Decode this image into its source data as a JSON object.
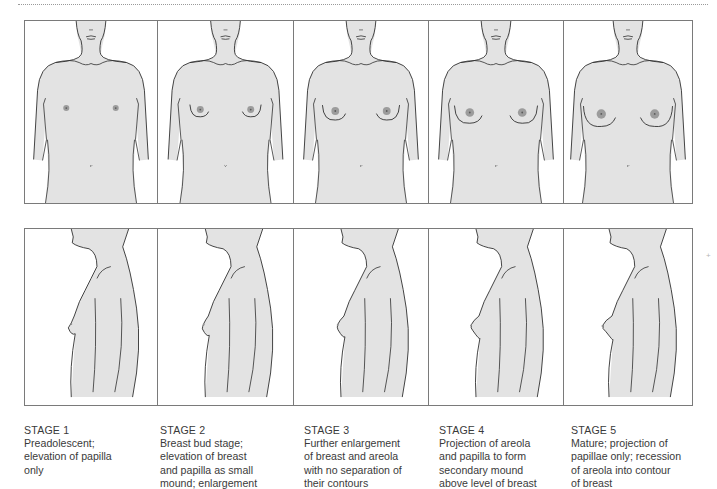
{
  "figure": {
    "colors": {
      "skin_fill": "#e3e3e3",
      "outline": "#2e2e2e",
      "areola": "#8f8f8f",
      "border": "#7a7a7a",
      "caption_text": "#3a3a3a"
    },
    "views": [
      "frontal",
      "lateral"
    ],
    "stages": [
      {
        "title": "STAGE 1",
        "description": "Preadolescent;\nelevation of papilla\nonly",
        "breast_development": 0.0,
        "areola_size": 0.35
      },
      {
        "title": "STAGE 2",
        "description": "Breast bud stage;\nelevation of breast\nand papilla as small\nmound; enlargement",
        "breast_development": 0.25,
        "areola_size": 0.5
      },
      {
        "title": "STAGE 3",
        "description": "Further enlargement\nof breast and areola\nwith no separation of\ntheir contours",
        "breast_development": 0.5,
        "areola_size": 0.65
      },
      {
        "title": "STAGE 4",
        "description": "Projection of areola\nand papilla to form\nsecondary mound\nabove level of breast",
        "breast_development": 0.75,
        "areola_size": 0.8
      },
      {
        "title": "STAGE 5",
        "description": "Mature; projection of\npapillae only; recession\nof areola into contour\nof breast",
        "breast_development": 1.0,
        "areola_size": 0.9
      }
    ]
  }
}
